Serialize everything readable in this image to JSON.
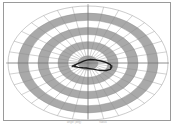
{
  "figure": {
    "title": "",
    "frame_color": "#9a9a9a",
    "background": "#ffffff",
    "band_color": "#a9a9a9",
    "gap_color": "#ffffff",
    "grid_color": "#8c8c8c",
    "axis_color": "#6e6e6e",
    "trace_color": "#1a1a1a"
  },
  "caption": {
    "left_text": "angle (deg)",
    "right_text": "radius"
  },
  "chart_data": {
    "type": "line",
    "title": "",
    "subtitle": "",
    "xlabel": "",
    "ylabel": "",
    "projection": "polar",
    "grid": true,
    "legend_position": "none",
    "center": {
      "x": 88,
      "y": 63
    },
    "radial_axis": {
      "label": "",
      "ticks": [
        1,
        2,
        3,
        4,
        5,
        6,
        7,
        8
      ],
      "tick_labels": [
        "",
        "",
        "",
        "",
        "",
        "",
        "",
        ""
      ],
      "range": [
        0,
        8
      ],
      "ring_count": 8,
      "shaded_rings": [
        1,
        3,
        5,
        7
      ],
      "ellipse_semi_major_px": 80,
      "ellipse_semi_minor_px": 57
    },
    "angular_axis": {
      "label": "",
      "spoke_count": 32,
      "spoke_step_deg": 11.25,
      "tick_labels": [
        "0",
        "90",
        "180",
        "270"
      ],
      "range_deg": [
        0,
        360
      ]
    },
    "crosshair": {
      "horizontal": true,
      "vertical": true
    },
    "series": [
      {
        "name": "trace",
        "color": "#1a1a1a",
        "width": 1.4,
        "points_polar": [
          {
            "theta_deg": 196,
            "r": 1.55
          },
          {
            "theta_deg": 188,
            "r": 1.15
          },
          {
            "theta_deg": 176,
            "r": 0.78
          },
          {
            "theta_deg": 150,
            "r": 0.52
          },
          {
            "theta_deg": 108,
            "r": 0.42
          },
          {
            "theta_deg": 62,
            "r": 0.55
          },
          {
            "theta_deg": 30,
            "r": 0.88
          },
          {
            "theta_deg": 12,
            "r": 1.35
          },
          {
            "theta_deg": 2,
            "r": 1.85
          },
          {
            "theta_deg": 354,
            "r": 2.25
          },
          {
            "theta_deg": 346,
            "r": 2.45
          },
          {
            "theta_deg": 338,
            "r": 2.4
          },
          {
            "theta_deg": 330,
            "r": 2.1
          },
          {
            "theta_deg": 322,
            "r": 1.7
          },
          {
            "theta_deg": 312,
            "r": 1.3
          },
          {
            "theta_deg": 300,
            "r": 1.0
          },
          {
            "theta_deg": 282,
            "r": 0.8
          },
          {
            "theta_deg": 258,
            "r": 0.72
          },
          {
            "theta_deg": 232,
            "r": 0.85
          },
          {
            "theta_deg": 212,
            "r": 1.15
          },
          {
            "theta_deg": 200,
            "r": 1.45
          }
        ]
      },
      {
        "name": "marker-cluster",
        "color": "#2a2a2a",
        "markers": [
          {
            "theta_deg": 196,
            "r": 1.62
          },
          {
            "theta_deg": 194,
            "r": 1.48
          },
          {
            "theta_deg": 192,
            "r": 1.3
          },
          {
            "theta_deg": 350,
            "r": 2.4
          },
          {
            "theta_deg": 345,
            "r": 2.35
          }
        ]
      }
    ]
  }
}
